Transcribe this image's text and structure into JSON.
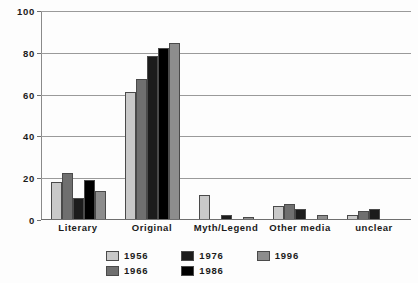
{
  "chart_data": {
    "type": "bar",
    "title": "",
    "subtitle": "",
    "xlabel": "",
    "ylabel": "",
    "ylim": [
      0,
      100
    ],
    "yticks": [
      0,
      20,
      40,
      60,
      80,
      100
    ],
    "grid": true,
    "legend_position": "bottom",
    "categories": [
      "Literary",
      "Original",
      "Myth/Legend",
      "Other media",
      "unclear"
    ],
    "series": [
      {
        "name": "1956",
        "color": "#c9c9c9",
        "values": [
          17.5,
          61,
          11.5,
          6,
          2
        ]
      },
      {
        "name": "1966",
        "color": "#6f6f6f",
        "values": [
          22,
          67,
          0,
          7,
          4
        ]
      },
      {
        "name": "1976",
        "color": "#1c1c1c",
        "values": [
          10,
          78,
          2,
          5,
          5
        ]
      },
      {
        "name": "1986",
        "color": "#000000",
        "values": [
          18.5,
          82,
          0,
          0,
          0
        ]
      },
      {
        "name": "1996",
        "color": "#8d8d8d",
        "values": [
          13.5,
          84,
          1,
          2,
          0
        ]
      }
    ]
  },
  "axis": {
    "y_tick_labels": [
      "100",
      "80",
      "60",
      "40",
      "20",
      "0"
    ]
  },
  "legend": {
    "entries": [
      {
        "label": "1956",
        "swatch": "#c9c9c9"
      },
      {
        "label": "1966",
        "swatch": "#6f6f6f"
      },
      {
        "label": "1976",
        "swatch": "#1c1c1c"
      },
      {
        "label": "1986",
        "swatch": "#000000"
      },
      {
        "label": "1996",
        "swatch": "#8d8d8d"
      }
    ]
  }
}
